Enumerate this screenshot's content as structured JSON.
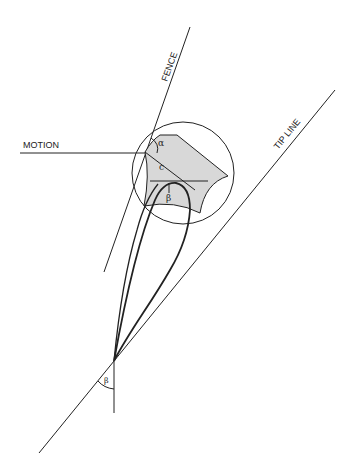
{
  "labels": {
    "motion": "MOTION",
    "fence": "FENCE",
    "tip_line": "TIP LINE",
    "alpha": "α",
    "c": "c",
    "beta_inner": "β",
    "beta_outer": "β"
  },
  "colors": {
    "stroke": "#222222",
    "shade": "#d8d8d8",
    "background": "#ffffff"
  }
}
